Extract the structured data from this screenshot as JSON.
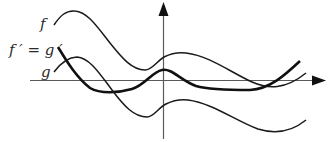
{
  "figure": {
    "labels": {
      "f": "f",
      "fprime_eq_gprime": "f ′ = g ′",
      "g": "g"
    },
    "curves": [
      {
        "name": "f",
        "style": "thin",
        "relationship": "g shifted upward by a constant"
      },
      {
        "name": "f' = g'",
        "style": "thick",
        "relationship": "common derivative of f and g"
      },
      {
        "name": "g",
        "style": "thin",
        "relationship": "f shifted downward by a constant"
      }
    ],
    "axes": {
      "x_axis": "horizontal with arrow pointing right",
      "y_axis": "vertical with arrow pointing up",
      "tick_labels": []
    },
    "colors": {
      "curve": "#1a1a1a",
      "axis": "#5a5a5a",
      "background": "#ffffff"
    }
  }
}
